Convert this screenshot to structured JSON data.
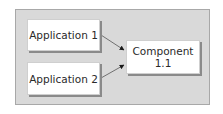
{
  "diagram": {
    "type": "dependency-diagram",
    "nodes": [
      {
        "id": "app1",
        "label": "Application 1"
      },
      {
        "id": "app2",
        "label": "Application 2"
      },
      {
        "id": "comp",
        "label_line1": "Component",
        "label_line2": "1.1"
      }
    ],
    "edges": [
      {
        "from": "app1",
        "to": "comp"
      },
      {
        "from": "app2",
        "to": "comp"
      }
    ],
    "colors": {
      "frame_background": "#d9d9d9",
      "frame_border": "#a8a8a8",
      "node_background": "#ffffff",
      "node_shadow": "#8a8a8a",
      "arrow": "#1a1a1a",
      "text": "#2a2a2a"
    }
  }
}
